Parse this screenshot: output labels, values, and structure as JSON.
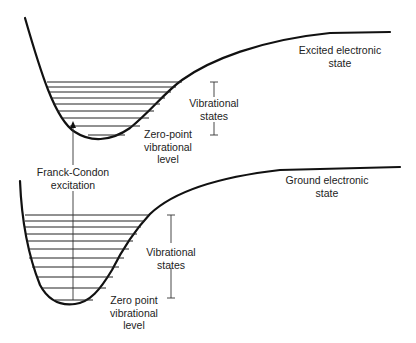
{
  "diagram": {
    "type": "potential-energy-curves",
    "excited_state": {
      "label_line1": "Excited electronic",
      "label_line2": "state",
      "zero_point_line1": "Zero-point",
      "zero_point_line2": "vibrational",
      "zero_point_line3": "level",
      "vib_line1": "Vibrational",
      "vib_line2": "states",
      "vibrational_level_count": 8
    },
    "ground_state": {
      "label_line1": "Ground electronic",
      "label_line2": "state",
      "zero_point_line1": "Zero point",
      "zero_point_line2": "vibrational",
      "zero_point_line3": "level",
      "vib_line1": "Vibrational",
      "vib_line2": "states",
      "vibrational_level_count": 11
    },
    "transition": {
      "label_line1": "Franck-Condon",
      "label_line2": "excitation"
    },
    "colors": {
      "line": "#111111",
      "text": "#222222",
      "background": "#ffffff"
    }
  }
}
